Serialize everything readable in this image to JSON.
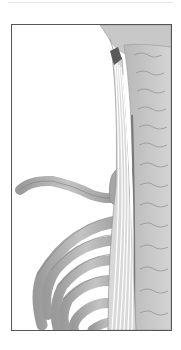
{
  "illustration": {
    "subject": "Anatomical illustration of neck and upper back muscle along cervical and thoracic spine with rib cage",
    "colors": {
      "frame": "#555555",
      "bone": "#a8a8a8",
      "bone_dark": "#8a8a8a",
      "muscle_fiber": "#ffffff",
      "muscle_tip": "#5a5a5a",
      "background": "#ffffff"
    }
  }
}
